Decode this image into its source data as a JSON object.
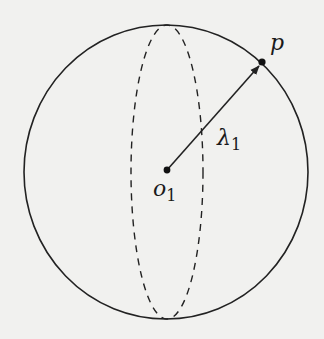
{
  "diagram": {
    "type": "sphere-radius",
    "colors": {
      "background": "#f1f1ef",
      "stroke": "#222222"
    },
    "sphere": {
      "cx": 166,
      "cy": 172,
      "rx": 142,
      "ry": 147
    },
    "equator_ellipse": {
      "cx": 167,
      "cy": 172,
      "rx": 36,
      "ry": 147,
      "style": "dashed"
    },
    "center_point": {
      "x": 167,
      "y": 170,
      "label": "o",
      "subscript": "1"
    },
    "surface_point": {
      "x": 262,
      "y": 62,
      "label": "p"
    },
    "radius_arrow": {
      "from": "o1",
      "to": "p",
      "label": "λ",
      "subscript": "1"
    }
  }
}
